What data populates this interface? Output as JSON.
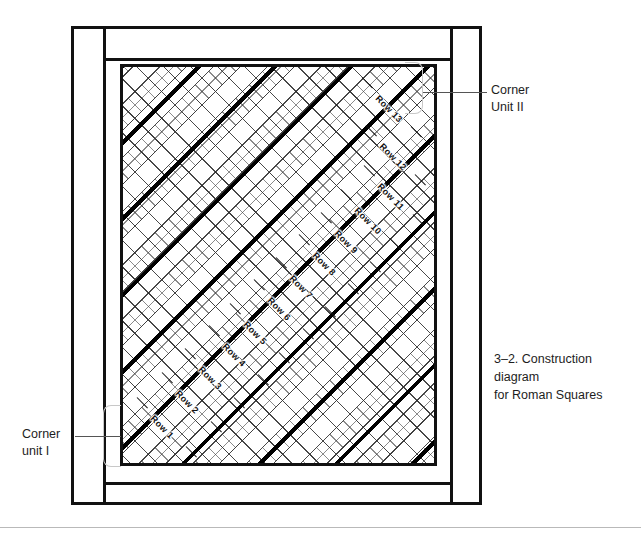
{
  "figure": {
    "caption": "3–2. Construction diagram\nfor Roman Squares",
    "pattern_name": "Roman Squares"
  },
  "annotations": {
    "corner_unit_2": {
      "label": "Corner\nUnit II"
    },
    "corner_unit_1": {
      "label": "Corner\nunit I"
    }
  },
  "diagram": {
    "rows": [
      {
        "label": "Row 1",
        "x": 152,
        "y": 412
      },
      {
        "label": "Row 2",
        "x": 177,
        "y": 387
      },
      {
        "label": "Row 3",
        "x": 200,
        "y": 363
      },
      {
        "label": "Row 4",
        "x": 224,
        "y": 340
      },
      {
        "label": "Row 5",
        "x": 245,
        "y": 318
      },
      {
        "label": "Row 6",
        "x": 269,
        "y": 294
      },
      {
        "label": "Row 7",
        "x": 291,
        "y": 272
      },
      {
        "label": "Row 8",
        "x": 314,
        "y": 249
      },
      {
        "label": "Row 9",
        "x": 336,
        "y": 227
      },
      {
        "label": "Row 10",
        "x": 356,
        "y": 204
      },
      {
        "label": "Row 11",
        "x": 379,
        "y": 180
      },
      {
        "label": "Row 12",
        "x": 381,
        "y": 140
      },
      {
        "label": "Row 13",
        "x": 377,
        "y": 92
      }
    ],
    "row_count": 13,
    "colors": {
      "line": "#111111",
      "bracket": "#c8c8c8",
      "leader": "#555555",
      "background": "#ffffff"
    }
  }
}
